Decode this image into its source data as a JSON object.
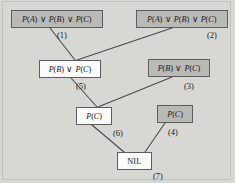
{
  "diagram": {
    "type": "resolution-refutation-tree",
    "title": "",
    "colors": {
      "page_background": "#d7d7d3",
      "node_fill_shaded": "#b9b9b6",
      "node_fill_plain": "#fbfbfa",
      "node_border": "#5d5d5d",
      "edge": "#4a4a4a",
      "text": "#1a1a1a"
    },
    "nodes": [
      {
        "id": "n1",
        "number": "(1)",
        "text": "P(A) ∨ P(B) ∨ P(C)",
        "parts": [
          "P(",
          "A",
          ") ∨ P(",
          "B",
          ") ∨ P(",
          "C",
          ")"
        ],
        "shaded": true,
        "x": 11,
        "y": 10,
        "w": 92,
        "h": 18,
        "label_x": 57,
        "label_y": 31
      },
      {
        "id": "n2",
        "number": "(2)",
        "text": "P(A) ∨ P(B) ∨ P(C)",
        "parts": [
          "P(",
          "A",
          ") ∨ P(",
          "B",
          ") ∨ P(",
          "C",
          ")"
        ],
        "shaded": true,
        "x": 136,
        "y": 10,
        "w": 92,
        "h": 18,
        "label_x": 207,
        "label_y": 31
      },
      {
        "id": "n5",
        "number": "(5)",
        "text": "P(B) ∨ P(C)",
        "parts": [
          "P(",
          "B",
          ") ∨ P(",
          "C",
          ")"
        ],
        "shaded": false,
        "x": 39,
        "y": 60,
        "w": 62,
        "h": 18,
        "label_x": 76,
        "label_y": 82
      },
      {
        "id": "n3",
        "number": "(3)",
        "text": "P(B) ∨ P(C)",
        "parts": [
          "P(",
          "B",
          ") ∨ P(",
          "C",
          ")"
        ],
        "shaded": true,
        "x": 148,
        "y": 59,
        "w": 62,
        "h": 18,
        "label_x": 184,
        "label_y": 82
      },
      {
        "id": "n6",
        "number": "(6)",
        "text": "P(C)",
        "parts": [
          "P(",
          "C",
          ")"
        ],
        "shaded": false,
        "x": 76,
        "y": 107,
        "w": 36,
        "h": 18,
        "label_x": 113,
        "label_y": 129
      },
      {
        "id": "n4",
        "number": "(4)",
        "text": "P(C)",
        "parts": [
          "P(",
          "C",
          ")"
        ],
        "shaded": true,
        "x": 157,
        "y": 105,
        "w": 36,
        "h": 18,
        "label_x": 168,
        "label_y": 128
      },
      {
        "id": "n7",
        "number": "(7)",
        "text": "NIL",
        "parts": [
          "NIL"
        ],
        "shaded": false,
        "x": 117,
        "y": 152,
        "w": 35,
        "h": 18,
        "label_x": 153,
        "label_y": 172
      }
    ],
    "edges": [
      {
        "from": "n1",
        "to": "n5",
        "x1": 50,
        "y1": 28,
        "x2": 75,
        "y2": 60
      },
      {
        "from": "n2",
        "to": "n5",
        "x1": 172,
        "y1": 28,
        "x2": 77,
        "y2": 60
      },
      {
        "from": "n5",
        "to": "n6",
        "x1": 71,
        "y1": 78,
        "x2": 97,
        "y2": 107
      },
      {
        "from": "n3",
        "to": "n6",
        "x1": 172,
        "y1": 77,
        "x2": 98,
        "y2": 107
      },
      {
        "from": "n6",
        "to": "n7",
        "x1": 92,
        "y1": 125,
        "x2": 124,
        "y2": 152
      },
      {
        "from": "n4",
        "to": "n7",
        "x1": 165,
        "y1": 123,
        "x2": 145,
        "y2": 152
      }
    ]
  }
}
